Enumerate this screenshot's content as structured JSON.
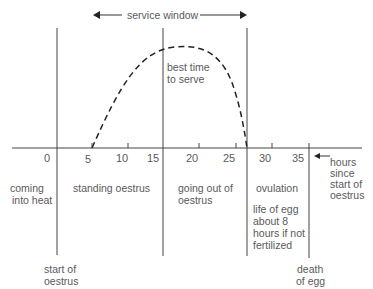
{
  "title_arrow": {
    "label": "service window"
  },
  "curve_label": {
    "line1": "best time",
    "line2": "to serve"
  },
  "axis": {
    "unit_label": {
      "line1": "hours",
      "line2": "since",
      "line3": "start of",
      "line4": "oestrus"
    },
    "ticks": [
      "0",
      "5",
      "10",
      "15",
      "20",
      "25",
      "30",
      "35"
    ]
  },
  "phases": {
    "coming": {
      "line1": "coming",
      "line2": "into heat"
    },
    "standing": {
      "line1": "standing oestrus"
    },
    "going_out": {
      "line1": "going out of",
      "line2": "oestrus"
    },
    "ovulation": {
      "line1": "ovulation"
    },
    "egg_life": {
      "line1": "life of egg",
      "line2": "about 8",
      "line3": "hours if not",
      "line4": "fertilized"
    }
  },
  "markers": {
    "start": {
      "line1": "start of",
      "line2": "oestrus"
    },
    "death": {
      "line1": "death",
      "line2": "of egg"
    }
  }
}
